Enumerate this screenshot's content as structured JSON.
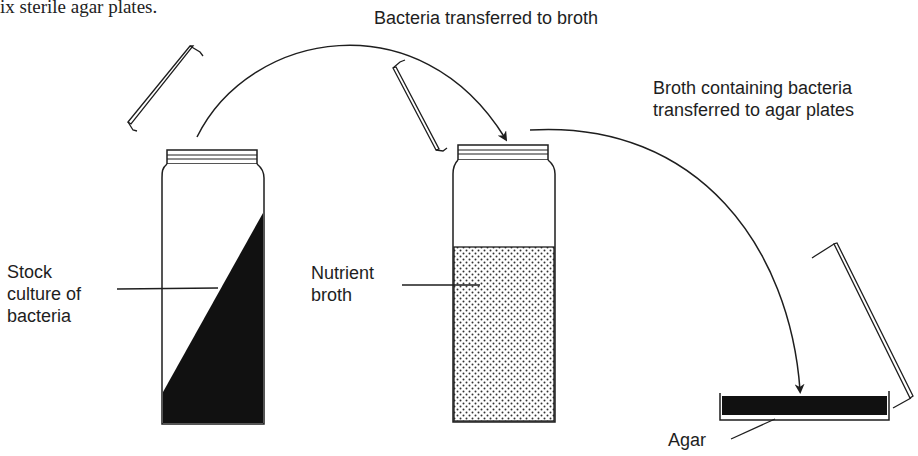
{
  "header_fragment": "ix sterile agar plates.",
  "labels": {
    "arrow1": "Bacteria transferred to broth",
    "arrow2_line1": "Broth containing bacteria",
    "arrow2_line2": "transferred to agar plates",
    "stock_line1": "Stock",
    "stock_line2": "culture of",
    "stock_line3": "bacteria",
    "broth_line1": "Nutrient",
    "broth_line2": "broth",
    "agar": "Agar"
  },
  "colors": {
    "ink": "#1e1e1e",
    "background": "#ffffff",
    "fill_dark": "#111111",
    "dot": "#333333"
  }
}
